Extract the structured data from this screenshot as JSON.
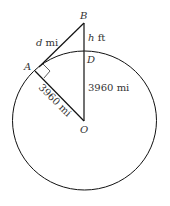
{
  "diagram": {
    "points": {
      "A": "A",
      "B": "B",
      "D": "D",
      "O": "O"
    },
    "labels": {
      "tangent": "d mi",
      "tangent_var": "d",
      "tangent_unit": " mi",
      "height": "h ft",
      "height_var": "h",
      "height_unit": " ft",
      "radius_vertical": "3960 mi",
      "radius_slanted": "3960 mi"
    },
    "colors": {
      "stroke": "#111111",
      "text": "#333333"
    }
  }
}
